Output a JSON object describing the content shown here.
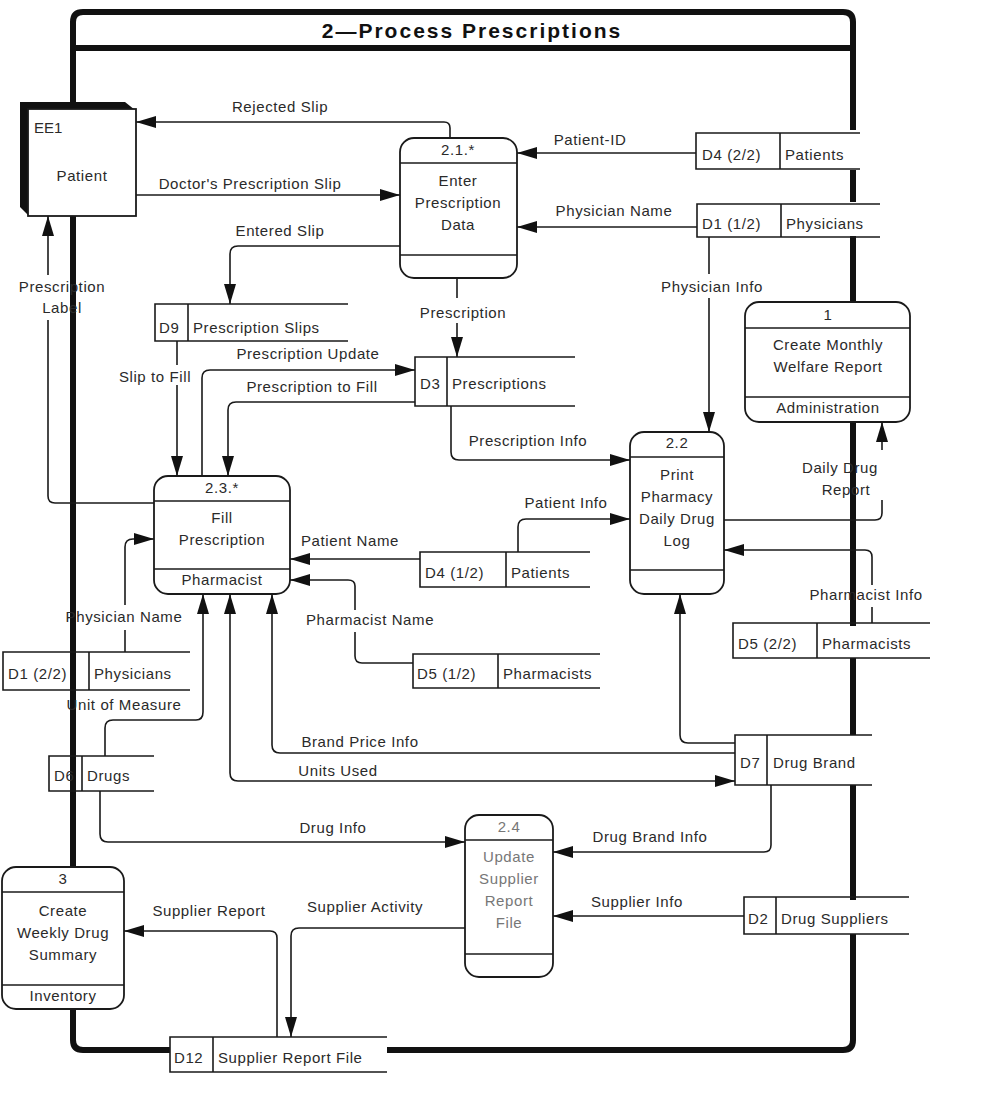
{
  "title": "2—Process Prescriptions",
  "colors": {
    "line": "#1a1a1a",
    "background": "#ffffff",
    "text": "#2a2a2a"
  },
  "external_entities": [
    {
      "id": "EE1",
      "name": "Patient"
    }
  ],
  "processes": {
    "p21": {
      "id": "2.1.*",
      "lines": [
        "Enter",
        "Prescription",
        "Data"
      ],
      "actor": ""
    },
    "p22": {
      "id": "2.2",
      "lines": [
        "Print",
        "Pharmacy",
        "Daily Drug",
        "Log"
      ],
      "actor": ""
    },
    "p23": {
      "id": "2.3.*",
      "lines": [
        "Fill",
        "Prescription"
      ],
      "actor": "Pharmacist"
    },
    "p24": {
      "id": "2.4",
      "lines": [
        "Update",
        "Supplier",
        "Report",
        "File"
      ],
      "actor": ""
    },
    "p1": {
      "id": "1",
      "lines": [
        "Create Monthly",
        "Welfare Report"
      ],
      "actor": "Administration"
    },
    "p3": {
      "id": "3",
      "lines": [
        "Create",
        "Weekly Drug",
        "Summary"
      ],
      "actor": "Inventory"
    }
  },
  "data_stores": {
    "d4_2": {
      "id": "D4 (2/2)",
      "name": "Patients"
    },
    "d1_1": {
      "id": "D1 (1/2)",
      "name": "Physicians"
    },
    "d9": {
      "id": "D9",
      "name": "Prescription Slips"
    },
    "d3": {
      "id": "D3",
      "name": "Prescriptions"
    },
    "d4_1": {
      "id": "D4 (1/2)",
      "name": "Patients"
    },
    "d5_1": {
      "id": "D5 (1/2)",
      "name": "Pharmacists"
    },
    "d5_2": {
      "id": "D5 (2/2)",
      "name": "Pharmacists"
    },
    "d1_2": {
      "id": "D1 (2/2)",
      "name": "Physicians"
    },
    "d6": {
      "id": "D6",
      "name": "Drugs"
    },
    "d7": {
      "id": "D7",
      "name": "Drug Brand"
    },
    "d2": {
      "id": "D2",
      "name": "Drug Suppliers"
    },
    "d12": {
      "id": "D12",
      "name": "Supplier Report File"
    }
  },
  "flows": {
    "rejected_slip": "Rejected Slip",
    "doctors_slip": "Doctor's Prescription Slip",
    "entered_slip": "Entered Slip",
    "patient_id": "Patient-ID",
    "physician_name_top": "Physician Name",
    "physician_info": "Physician Info",
    "prescription_label_1": "Prescription",
    "prescription_label_2": "Label",
    "prescription": "Prescription",
    "prescription_update": "Prescription Update",
    "slip_to_fill": "Slip to Fill",
    "prescription_to_fill": "Prescription to Fill",
    "prescription_info": "Prescription Info",
    "daily_drug_report_1": "Daily Drug",
    "daily_drug_report_2": "Report",
    "patient_info": "Patient Info",
    "patient_name": "Patient Name",
    "pharmacist_info": "Pharmacist Info",
    "pharmacist_name": "Pharmacist Name",
    "physician_name_left": "Physician Name",
    "unit_of_measure": "Unit of Measure",
    "brand_price_info": "Brand Price Info",
    "units_used": "Units Used",
    "drug_info": "Drug Info",
    "drug_brand_info": "Drug Brand Info",
    "supplier_info": "Supplier Info",
    "supplier_report": "Supplier Report",
    "supplier_activity": "Supplier Activity"
  }
}
